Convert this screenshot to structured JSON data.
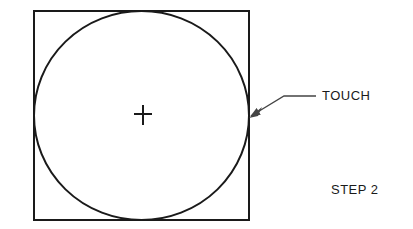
{
  "diagram": {
    "type": "technical-illustration",
    "colors": {
      "line": "#1a1a1a",
      "background": "#ffffff"
    },
    "shapes": {
      "square": {
        "x": 34,
        "y": 11,
        "width": 215,
        "height": 209
      },
      "circle": {
        "cx": 141.5,
        "cy": 115.5,
        "rx": 107.5,
        "ry": 104.5
      },
      "center_mark": {
        "x": 143,
        "y": 114,
        "arm": 9,
        "icon": "crosshair-icon"
      }
    },
    "callout": {
      "label": "TOUCH",
      "arrow_icon": "arrow-pointer-icon",
      "leader_points": [
        [
          315,
          96
        ],
        [
          283,
          96
        ],
        [
          250,
          117
        ]
      ]
    },
    "step_label": "STEP 2"
  }
}
